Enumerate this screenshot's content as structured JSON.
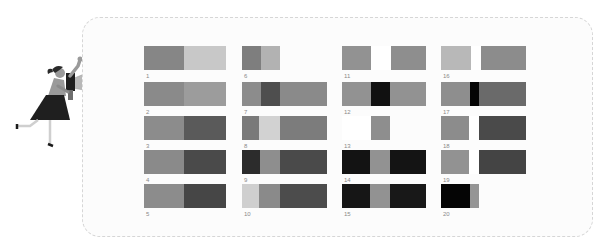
{
  "illustration": {
    "name": "woman-with-megaphone",
    "colors": {
      "skin_shirt": "#9a9a9a",
      "skirt": "#1f1f1f",
      "megaphone": "#b5b5b5",
      "hair": "#2a2a2a"
    }
  },
  "palette": {
    "very_light": "#d2d2d2",
    "light": "#b4b4b4",
    "mid": "#929292",
    "mid_dark": "#7b7b7b",
    "dark": "#4e4e4e",
    "very_dark": "#2b2b2b",
    "black": "#0c0c0c"
  },
  "items": [
    {
      "label": "1",
      "x": 144,
      "y": 46,
      "segments": [
        {
          "w": 40,
          "c": "#868686"
        },
        {
          "w": 42,
          "c": "#c8c8c8"
        }
      ]
    },
    {
      "label": "2",
      "x": 144,
      "y": 82,
      "segments": [
        {
          "w": 40,
          "c": "#8a8a8a"
        },
        {
          "w": 42,
          "c": "#9c9c9c"
        }
      ]
    },
    {
      "label": "3",
      "x": 144,
      "y": 116,
      "segments": [
        {
          "w": 40,
          "c": "#8c8c8c"
        },
        {
          "w": 42,
          "c": "#5a5a5a"
        }
      ]
    },
    {
      "label": "4",
      "x": 144,
      "y": 150,
      "segments": [
        {
          "w": 40,
          "c": "#8a8a8a"
        },
        {
          "w": 42,
          "c": "#4a4a4a"
        }
      ]
    },
    {
      "label": "5",
      "x": 144,
      "y": 184,
      "segments": [
        {
          "w": 40,
          "c": "#8c8c8c"
        },
        {
          "w": 42,
          "c": "#464646"
        }
      ]
    },
    {
      "label": "6",
      "x": 242,
      "y": 46,
      "segments": [
        {
          "w": 19,
          "c": "#7e7e7e"
        },
        {
          "w": 19,
          "c": "#b2b2b2"
        }
      ]
    },
    {
      "label": "7",
      "x": 242,
      "y": 82,
      "segments": [
        {
          "w": 19,
          "c": "#8c8c8c"
        },
        {
          "w": 19,
          "c": "#4e4e4e"
        },
        {
          "w": 47,
          "c": "#8a8a8a"
        }
      ]
    },
    {
      "label": "8",
      "x": 242,
      "y": 116,
      "segments": [
        {
          "w": 17,
          "c": "#7a7a7a"
        },
        {
          "w": 21,
          "c": "#d2d2d2"
        },
        {
          "w": 47,
          "c": "#7c7c7c"
        }
      ]
    },
    {
      "label": "9",
      "x": 242,
      "y": 150,
      "segments": [
        {
          "w": 18,
          "c": "#2c2c2c"
        },
        {
          "w": 20,
          "c": "#8e8e8e"
        },
        {
          "w": 47,
          "c": "#4a4a4a"
        }
      ]
    },
    {
      "label": "10",
      "x": 242,
      "y": 184,
      "segments": [
        {
          "w": 17,
          "c": "#cfcfcf"
        },
        {
          "w": 21,
          "c": "#8a8a8a"
        },
        {
          "w": 47,
          "c": "#4c4c4c"
        }
      ]
    },
    {
      "label": "11",
      "x": 342,
      "y": 46,
      "segments": [
        {
          "w": 29,
          "c": "#929292"
        },
        {
          "w": 20,
          "c": "#ffffff"
        },
        {
          "w": 35,
          "c": "#8e8e8e"
        }
      ]
    },
    {
      "label": "12",
      "x": 342,
      "y": 82,
      "segments": [
        {
          "w": 29,
          "c": "#929292"
        },
        {
          "w": 19,
          "c": "#111111"
        },
        {
          "w": 36,
          "c": "#929292"
        }
      ]
    },
    {
      "label": "13",
      "x": 342,
      "y": 116,
      "segments": [
        {
          "w": 29,
          "c": "#ffffff"
        },
        {
          "w": 19,
          "c": "#8e8e8e"
        }
      ]
    },
    {
      "label": "14",
      "x": 342,
      "y": 150,
      "segments": [
        {
          "w": 28,
          "c": "#131313"
        },
        {
          "w": 20,
          "c": "#929292"
        },
        {
          "w": 36,
          "c": "#141414"
        }
      ]
    },
    {
      "label": "15",
      "x": 342,
      "y": 184,
      "segments": [
        {
          "w": 28,
          "c": "#161616"
        },
        {
          "w": 20,
          "c": "#929292"
        },
        {
          "w": 36,
          "c": "#181818"
        }
      ]
    },
    {
      "label": "16",
      "x": 441,
      "y": 46,
      "segments": [
        {
          "w": 30,
          "c": "#b8b8b8"
        },
        {
          "w": 10,
          "c": "#ffffff"
        },
        {
          "w": 45,
          "c": "#8c8c8c"
        }
      ]
    },
    {
      "label": "17",
      "x": 441,
      "y": 82,
      "segments": [
        {
          "w": 29,
          "c": "#8e8e8e"
        },
        {
          "w": 9,
          "c": "#050505"
        },
        {
          "w": 47,
          "c": "#6a6a6a"
        }
      ]
    },
    {
      "label": "18",
      "x": 441,
      "y": 116,
      "segments": [
        {
          "w": 28,
          "c": "#8c8c8c"
        },
        {
          "w": 10,
          "c": "#ffffff"
        },
        {
          "w": 47,
          "c": "#4a4a4a"
        }
      ]
    },
    {
      "label": "19",
      "x": 441,
      "y": 150,
      "segments": [
        {
          "w": 28,
          "c": "#929292"
        },
        {
          "w": 10,
          "c": "#ffffff"
        },
        {
          "w": 47,
          "c": "#444444"
        }
      ]
    },
    {
      "label": "20",
      "x": 441,
      "y": 184,
      "segments": [
        {
          "w": 29,
          "c": "#050505"
        },
        {
          "w": 9,
          "c": "#959595"
        }
      ]
    }
  ]
}
